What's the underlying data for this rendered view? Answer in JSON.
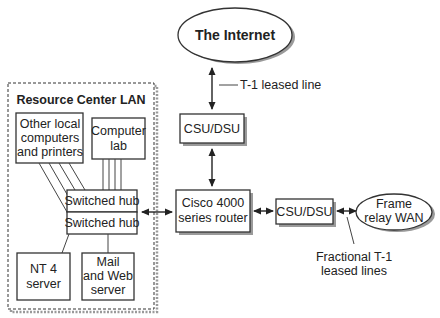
{
  "diagram": {
    "internet": {
      "label": "The Internet"
    },
    "t1_leased_line": {
      "label": "T-1 leased line"
    },
    "csu_dsu_top": {
      "label": "CSU/DSU"
    },
    "router": {
      "line1": "Cisco 4000",
      "line2": "series router"
    },
    "csu_dsu_right": {
      "label": "CSU/DSU"
    },
    "frame_relay": {
      "line1": "Frame",
      "line2": "relay WAN"
    },
    "fractional_t1": {
      "line1": "Fractional T-1",
      "line2": "leased lines"
    },
    "lan": {
      "title": "Resource Center LAN",
      "other_local": {
        "line1": "Other local",
        "line2": "computers",
        "line3": "and printers"
      },
      "computer_lab": {
        "line1": "Computer",
        "line2": "lab"
      },
      "hub1": {
        "label": "Switched hub"
      },
      "hub2": {
        "label": "Switched hub"
      },
      "nt4": {
        "line1": "NT 4",
        "line2": "server"
      },
      "mail_web": {
        "line1": "Mail",
        "line2": "and Web",
        "line3": "server"
      }
    }
  }
}
